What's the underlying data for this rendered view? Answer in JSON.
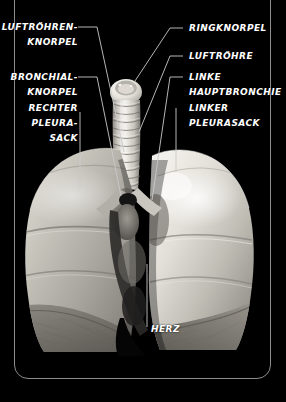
{
  "plate": {
    "background_color": "#000000",
    "frame_color": "#8d8d8d",
    "label_color": "#ffffff",
    "leader_color": "#c9c9c9",
    "subject": "lungs-and-trachea-anatomical-plate",
    "language": "de"
  },
  "labels_left": [
    {
      "id": "luftroehren-knorpel",
      "lines": [
        "LUFTRÖHREN-",
        "KNORPEL"
      ]
    },
    {
      "id": "bronchial-knorpel",
      "lines": [
        "BRONCHIAL-",
        "KNORPEL"
      ]
    },
    {
      "id": "rechter-pleurasack",
      "lines": [
        "RECHTER",
        "PLEURA-",
        "SACK"
      ]
    }
  ],
  "labels_right": [
    {
      "id": "ringknorpel",
      "lines": [
        "RINGKNORPEL"
      ]
    },
    {
      "id": "luftroehre",
      "lines": [
        "LUFTRÖHRE"
      ]
    },
    {
      "id": "linke-hauptbronchie",
      "lines": [
        "LINKE",
        "HAUPTBRONCHIE"
      ]
    },
    {
      "id": "linker-pleurasack",
      "lines": [
        "LINKER",
        "PLEURASACK"
      ]
    }
  ],
  "labels_center": [
    {
      "id": "herz",
      "lines": [
        "HERZ"
      ]
    }
  ],
  "text": {
    "luftroehren_knorpel_1": "LUFTRÖHREN-",
    "luftroehren_knorpel_2": "KNORPEL",
    "bronchial_knorpel_1": "BRONCHIAL-",
    "bronchial_knorpel_2": "KNORPEL",
    "rechter_pleurasack_1": "RECHTER",
    "rechter_pleurasack_2": "PLEURA-",
    "rechter_pleurasack_3": "SACK",
    "ringknorpel": "RINGKNORPEL",
    "luftroehre": "LUFTRÖHRE",
    "linke_hauptbronchie_1": "LINKE",
    "linke_hauptbronchie_2": "HAUPTBRONCHIE",
    "linker_pleurasack_1": "LINKER",
    "linker_pleurasack_2": "PLEURASACK",
    "herz": "HERZ"
  }
}
